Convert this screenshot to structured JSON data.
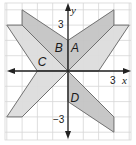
{
  "figure": {
    "axes": {
      "x_label": "x",
      "y_label": "y",
      "x_tick_label": "3",
      "y_tick_label": "3",
      "y_neg_tick_label": "−3"
    },
    "grid": {
      "min": -4,
      "max": 4,
      "step": 1
    },
    "colors": {
      "dark_fill": "#c4c4c4",
      "light_fill": "#dcdcdc",
      "grid": "#d6d6d6",
      "axis": "#222222",
      "edge": "#707070"
    },
    "shapes": [
      {
        "id": "C",
        "label": "C",
        "shade": "light",
        "vertices": [
          [
            0,
            0
          ],
          [
            -3,
            3
          ],
          [
            -4,
            3
          ],
          [
            -2,
            0
          ]
        ],
        "label_pos": [
          -1.7,
          0.55
        ]
      },
      {
        "id": "right-light",
        "label": "",
        "shade": "light",
        "vertices": [
          [
            0,
            0
          ],
          [
            3,
            3
          ],
          [
            4,
            3
          ],
          [
            2,
            0
          ]
        ],
        "label_pos": null
      },
      {
        "id": "bottom-left-light",
        "label": "",
        "shade": "light",
        "vertices": [
          [
            0,
            0
          ],
          [
            -2,
            0
          ],
          [
            -4,
            -3
          ],
          [
            -3,
            -3
          ]
        ],
        "label_pos": null
      },
      {
        "id": "B",
        "label": "B",
        "shade": "dark",
        "vertices": [
          [
            0,
            0
          ],
          [
            0,
            2
          ],
          [
            -3,
            4
          ],
          [
            -3,
            3
          ]
        ],
        "label_pos": [
          -0.6,
          1.45
        ]
      },
      {
        "id": "A",
        "label": "A",
        "shade": "dark",
        "vertices": [
          [
            0,
            0
          ],
          [
            0,
            2
          ],
          [
            3,
            4
          ],
          [
            3,
            3
          ]
        ],
        "label_pos": [
          0.45,
          1.45
        ]
      },
      {
        "id": "D",
        "label": "D",
        "shade": "dark",
        "vertices": [
          [
            0,
            0
          ],
          [
            0,
            -2
          ],
          [
            3,
            -4
          ],
          [
            3,
            -3
          ]
        ],
        "label_pos": [
          0.45,
          -1.8
        ]
      }
    ]
  }
}
